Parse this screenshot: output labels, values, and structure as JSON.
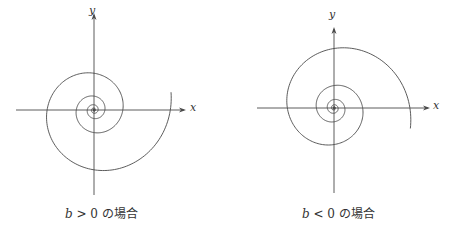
{
  "colors": {
    "stroke": "#4a4a4a",
    "text": "#333333",
    "background": "#ffffff"
  },
  "panels": [
    {
      "id": "left",
      "caption": {
        "var": "b",
        "rel": " > 0 の場合"
      },
      "axes": {
        "x_label": "x",
        "y_label": "y"
      },
      "origin": [
        94,
        110
      ],
      "x_axis": [
        16,
        186
      ],
      "y_axis": [
        13,
        195
      ],
      "spiral": {
        "a": 1.2,
        "b": 0.155,
        "turns": 4.3,
        "end_angle_deg": -13,
        "direction": 1
      }
    },
    {
      "id": "right",
      "caption": {
        "var": "b",
        "rel": " < 0 の場合"
      },
      "axes": {
        "x_label": "x",
        "y_label": "y"
      },
      "origin": [
        107,
        108
      ],
      "x_axis": [
        30,
        203
      ],
      "y_axis": [
        27,
        193
      ],
      "spiral": {
        "a": 1.2,
        "b": 0.155,
        "turns": 4.3,
        "end_angle_deg": 15,
        "direction": -1
      }
    }
  ]
}
